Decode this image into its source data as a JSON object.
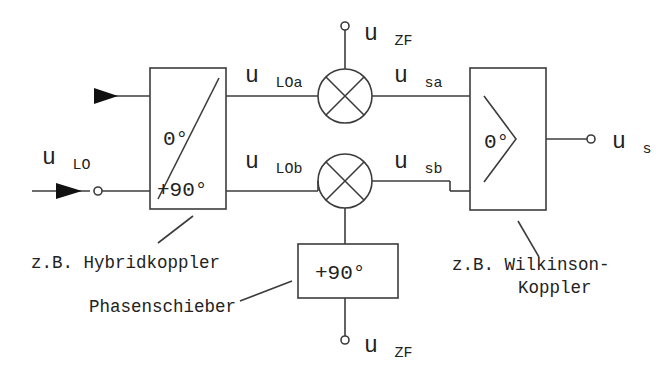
{
  "diagram": {
    "type": "block-diagram",
    "background_color": "#ffffff",
    "line_color": "#3c3c3c",
    "text_color": "#222222"
  },
  "blocks": {
    "hybrid_coupler": {
      "label_top": "0°",
      "label_bottom": "+90°",
      "caption": "z.B. Hybridkoppler"
    },
    "phase_shifter": {
      "label": "+90°",
      "caption": "Phasenschieber"
    },
    "wilkinson_coupler": {
      "label": "0°",
      "caption_line1": "z.B. Wilkinson-",
      "caption_line2": "Koppler"
    },
    "mixer_upper": {
      "symbol": "mixer-cross"
    },
    "mixer_lower": {
      "symbol": "mixer-cross"
    }
  },
  "signals": {
    "lo_input": {
      "base": "u",
      "sub": "LO"
    },
    "lo_a": {
      "base": "u",
      "sub": "LOa"
    },
    "lo_b": {
      "base": "u",
      "sub": "LOb"
    },
    "zf_upper": {
      "base": "u",
      "sub": "ZF"
    },
    "zf_lower": {
      "base": "u",
      "sub": "ZF"
    },
    "s_a": {
      "base": "u",
      "sub": "sa"
    },
    "s_b": {
      "base": "u",
      "sub": "sb"
    },
    "s_out": {
      "base": "u",
      "sub": "s"
    }
  }
}
